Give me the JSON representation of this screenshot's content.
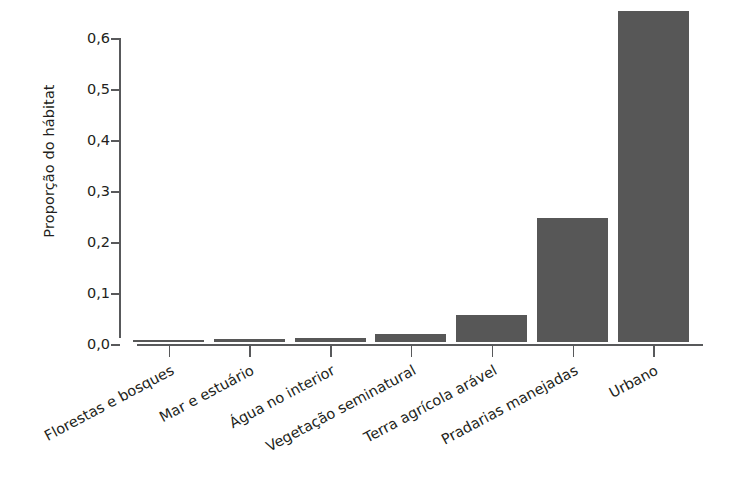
{
  "chart_data": {
    "type": "bar",
    "title": "",
    "subtitle": "",
    "xlabel": "",
    "ylabel": "Proporção do hábitat",
    "categories": [
      "Florestas e bosques",
      "Mar e estuário",
      "Água no interior",
      "Vegetação seminatural",
      "Terra agrícola arável",
      "Pradarias manejadas",
      "Urbano"
    ],
    "values": [
      0.003,
      0.005,
      0.008,
      0.016,
      0.052,
      0.243,
      0.65
    ],
    "ylim": [
      0.0,
      0.6
    ],
    "ytick_values": [
      0.0,
      0.1,
      0.2,
      0.3,
      0.4,
      0.5,
      0.6
    ],
    "ytick_labels": [
      "0,0",
      "0,1",
      "0,2",
      "0,3",
      "0,4",
      "0,5",
      "0,6"
    ],
    "grid": false,
    "legend": null,
    "legend_position": "none",
    "bar_color": "#575757",
    "axis_color": "#58595b",
    "text_color": "#231f20",
    "background_color": "#ffffff",
    "xtick_label_rotation": -28
  }
}
